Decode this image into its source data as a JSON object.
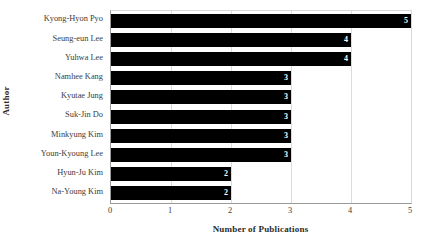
{
  "chart_data": {
    "type": "bar",
    "orientation": "horizontal",
    "title": "",
    "xlabel": "Number of Publications",
    "ylabel": "Author",
    "xlim": [
      0,
      5
    ],
    "xticks": [
      "0",
      "1",
      "2",
      "3",
      "4",
      "5"
    ],
    "grid": true,
    "legend": false,
    "bar_color": "#000000",
    "value_label_color": "#ffffff",
    "categories": [
      "Kyong-Hyon Pyo",
      "Seung-eun Lee",
      "Yuhwa Lee",
      "Namhee Kang",
      "Kyutae Jung",
      "Suk-Jin Do",
      "Minkyung Kim",
      "Youn-Kyoung Lee",
      "Hyun-Ju Kim",
      "Na-Young Kim"
    ],
    "values": [
      5,
      4,
      4,
      3,
      3,
      3,
      3,
      3,
      2,
      2
    ],
    "value_labels": [
      "5",
      "4",
      "4",
      "3",
      "3",
      "3",
      "3",
      "3",
      "2",
      "2"
    ]
  }
}
